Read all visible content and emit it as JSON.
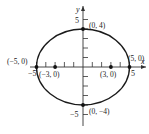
{
  "diagram": {
    "type": "ellipse",
    "equation": "x^2/25 + y^2/16 = 1",
    "axes": {
      "x_label": "x",
      "y_label": "y",
      "x_tick_labels": {
        "neg": "−5",
        "pos": "5"
      },
      "y_tick_labels": {
        "pos": "5",
        "neg": "−5"
      }
    },
    "points": [
      {
        "id": "vertex-top",
        "label": "(0, 4)",
        "x": 0,
        "y": 4
      },
      {
        "id": "vertex-bottom",
        "label": "(0, −4)",
        "x": 0,
        "y": -4
      },
      {
        "id": "vertex-left",
        "label": "(−5, 0)",
        "x": -5,
        "y": 0
      },
      {
        "id": "vertex-right",
        "label": "(5, 0)",
        "x": 5,
        "y": 0
      },
      {
        "id": "focus-left",
        "label": "(−3, 0)",
        "x": -3,
        "y": 0
      },
      {
        "id": "focus-right",
        "label": "(3, 0)",
        "x": 3,
        "y": 0
      }
    ],
    "colors": {
      "curve": "#1a1a1a",
      "axes": "#333333",
      "points": "#111111"
    }
  }
}
